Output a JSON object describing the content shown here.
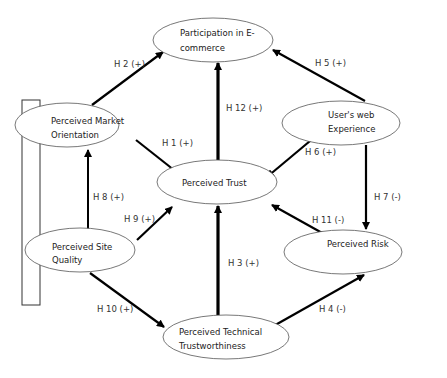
{
  "diagram": {
    "type": "research-model",
    "nodes": [
      {
        "id": "participation",
        "lines": [
          "Participation in E-",
          "commerce"
        ],
        "cx": 213,
        "cy": 40,
        "rx": 60,
        "ry": 22
      },
      {
        "id": "market_orientation",
        "lines": [
          "Perceived Market",
          "Orientation"
        ],
        "cx": 67,
        "cy": 125,
        "rx": 52,
        "ry": 22
      },
      {
        "id": "web_experience",
        "lines": [
          "User's web",
          "Experience"
        ],
        "cx": 341,
        "cy": 123,
        "rx": 59,
        "ry": 22
      },
      {
        "id": "trust",
        "lines": [
          "Perceived Trust"
        ],
        "cx": 217,
        "cy": 182,
        "rx": 60,
        "ry": 22
      },
      {
        "id": "site_quality",
        "lines": [
          "Perceived Site",
          "Quality"
        ],
        "cx": 80,
        "cy": 250,
        "rx": 55,
        "ry": 22
      },
      {
        "id": "risk",
        "lines": [
          "Perceived Risk"
        ],
        "cx": 343,
        "cy": 252,
        "rx": 59,
        "ry": 22
      },
      {
        "id": "technical_trust",
        "lines": [
          "Perceived Technical",
          "Trustworthiness"
        ],
        "cx": 226,
        "cy": 337,
        "rx": 63,
        "ry": 22
      }
    ],
    "edges": [
      {
        "label": "H 1 (+)",
        "from": "market_orientation",
        "to": "trust"
      },
      {
        "label": "H 2 (+)",
        "from": "market_orientation",
        "to": "participation"
      },
      {
        "label": "H 3 (+)",
        "from": "technical_trust",
        "to": "trust"
      },
      {
        "label": "H 4 (-)",
        "from": "technical_trust",
        "to": "risk"
      },
      {
        "label": "H 5 (+)",
        "from": "web_experience",
        "to": "participation"
      },
      {
        "label": "H 6 (+)",
        "from": "web_experience",
        "to": "trust"
      },
      {
        "label": "H 7 (-)",
        "from": "web_experience",
        "to": "risk"
      },
      {
        "label": "H 8 (+)",
        "from": "site_quality",
        "to": "market_orientation"
      },
      {
        "label": "H 9 (+)",
        "from": "site_quality",
        "to": "trust"
      },
      {
        "label": "H 10 (+)",
        "from": "site_quality",
        "to": "technical_trust"
      },
      {
        "label": "H 11 (-)",
        "from": "risk",
        "to": "trust"
      },
      {
        "label": "H 12 (+)",
        "from": "trust",
        "to": "participation"
      }
    ],
    "colors": {
      "stroke": "#000000",
      "text": "#222222",
      "background": "#ffffff"
    }
  }
}
